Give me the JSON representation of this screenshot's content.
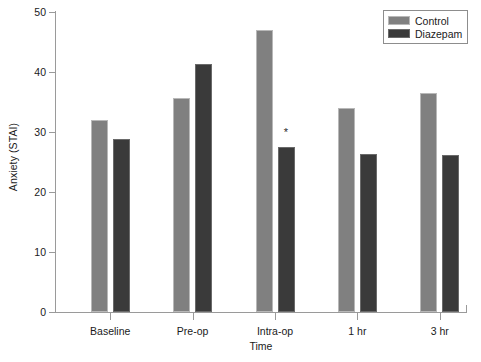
{
  "chart_data": {
    "type": "bar",
    "title": "",
    "xlabel": "Time",
    "ylabel": "Anxiety (STAI)",
    "categories": [
      "Baseline",
      "Pre-op",
      "Intra-op",
      "1 hr",
      "3 hr"
    ],
    "series": [
      {
        "name": "Control",
        "color": "#808080",
        "values": [
          32.0,
          35.6,
          47.0,
          34.0,
          36.5
        ]
      },
      {
        "name": "Diazepam",
        "color": "#3a3a3a",
        "values": [
          28.8,
          41.4,
          27.5,
          26.3,
          26.2
        ]
      }
    ],
    "ylim": [
      0,
      50
    ],
    "yticks": [
      0,
      10,
      20,
      30,
      40,
      50
    ],
    "ytick_labels": [
      "0",
      "10",
      "20",
      "30",
      "40",
      "50"
    ],
    "grid": false,
    "legend_position": "top-right",
    "annotations": [
      {
        "text": "*",
        "category": "Intra-op",
        "series": "Diazepam",
        "value": 30.0
      }
    ]
  },
  "legend": {
    "entries": [
      {
        "label": "Control"
      },
      {
        "label": "Diazepam"
      }
    ]
  }
}
